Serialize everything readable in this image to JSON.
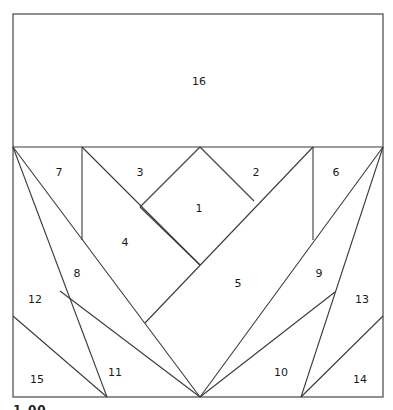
{
  "diagram": {
    "type": "paper-piecing-pattern",
    "frame": {
      "x1": 13,
      "y1": 14,
      "x2": 383,
      "y2": 397
    },
    "divider_y": 147,
    "colors": {
      "line": "#3a3a3a",
      "frame": "#555555",
      "background": "#ffffff"
    },
    "lines": [
      [
        13,
        147,
        383,
        147
      ],
      [
        82,
        147,
        82,
        240
      ],
      [
        313,
        147,
        313,
        240
      ],
      [
        200,
        147,
        140,
        207
      ],
      [
        200,
        147,
        254,
        201
      ],
      [
        140,
        207,
        200,
        265
      ],
      [
        82,
        147,
        200,
        265
      ],
      [
        313,
        147,
        145,
        323
      ],
      [
        13,
        147,
        200,
        397
      ],
      [
        383,
        147,
        200,
        397
      ],
      [
        13,
        147,
        107,
        397
      ],
      [
        383,
        147,
        301,
        397
      ],
      [
        60,
        291,
        200,
        397
      ],
      [
        335,
        292,
        200,
        397
      ],
      [
        13,
        316,
        107,
        397
      ],
      [
        383,
        316,
        301,
        397
      ]
    ],
    "pieces": [
      {
        "id": "1",
        "label": "1",
        "x": 199,
        "y": 208
      },
      {
        "id": "2",
        "label": "2",
        "x": 256,
        "y": 172
      },
      {
        "id": "3",
        "label": "3",
        "x": 140,
        "y": 172
      },
      {
        "id": "4",
        "label": "4",
        "x": 125,
        "y": 242
      },
      {
        "id": "5",
        "label": "5",
        "x": 238,
        "y": 283
      },
      {
        "id": "6",
        "label": "6",
        "x": 336,
        "y": 172
      },
      {
        "id": "7",
        "label": "7",
        "x": 59,
        "y": 172
      },
      {
        "id": "8",
        "label": "8",
        "x": 77,
        "y": 273
      },
      {
        "id": "9",
        "label": "9",
        "x": 319,
        "y": 273
      },
      {
        "id": "10",
        "label": "10",
        "x": 281,
        "y": 372
      },
      {
        "id": "11",
        "label": "11",
        "x": 115,
        "y": 372
      },
      {
        "id": "12",
        "label": "12",
        "x": 35,
        "y": 299
      },
      {
        "id": "13",
        "label": "13",
        "x": 362,
        "y": 299
      },
      {
        "id": "14",
        "label": "14",
        "x": 360,
        "y": 379
      },
      {
        "id": "15",
        "label": "15",
        "x": 37,
        "y": 379
      },
      {
        "id": "16",
        "label": "16",
        "x": 199,
        "y": 81
      }
    ],
    "footer_text_partial": "1.00"
  }
}
